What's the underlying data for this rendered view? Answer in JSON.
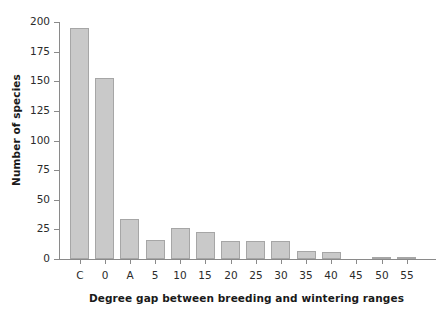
{
  "chart_data": {
    "type": "bar",
    "title": "",
    "xlabel": "Degree gap between breeding and wintering ranges",
    "ylabel": "Number of species",
    "categories": [
      "C",
      "0",
      "A",
      "5",
      "10",
      "15",
      "20",
      "25",
      "30",
      "35",
      "40",
      "45",
      "50",
      "55"
    ],
    "values": [
      195,
      153,
      34,
      16,
      26,
      23,
      15,
      15,
      15,
      7,
      6,
      0,
      1.5,
      2
    ],
    "ylim": [
      0,
      200
    ],
    "yticks": [
      0,
      25,
      50,
      75,
      100,
      125,
      150,
      175,
      200
    ],
    "ytick_labels": [
      "0",
      "25",
      "50",
      "75",
      "100",
      "125",
      "150",
      "175",
      "200"
    ],
    "grid": false,
    "legend": null,
    "bar_color": "#c9c9c9",
    "bar_edge_color": "#a6a6a6",
    "axis_color": "#8a8a8a",
    "text_color": "#2b2b2b"
  }
}
